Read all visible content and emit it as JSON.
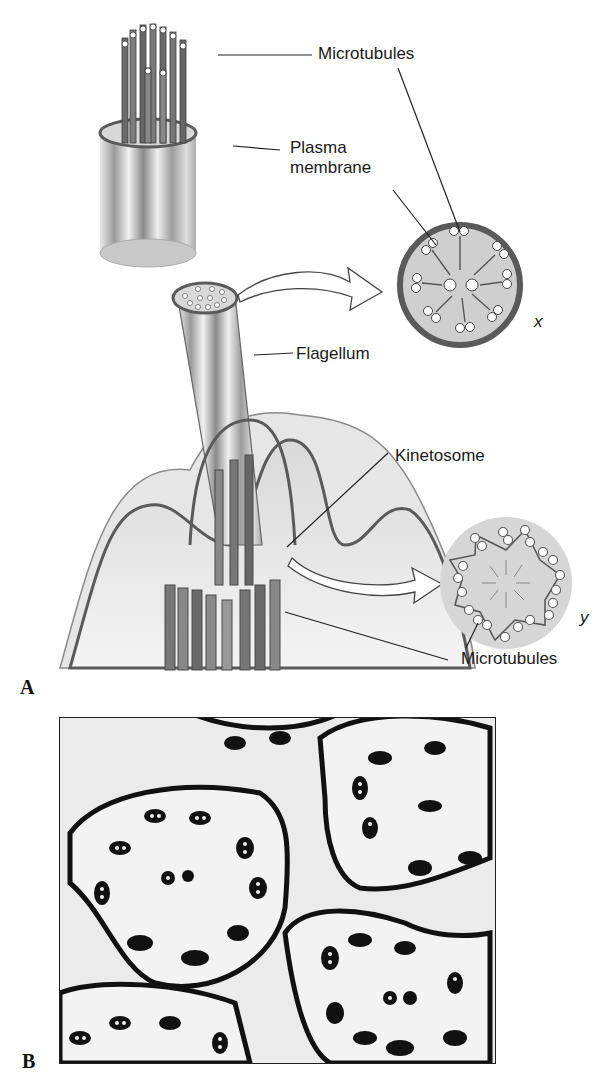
{
  "figure": {
    "panels": [
      {
        "id": "A",
        "label": "A",
        "description": "Illustration of a flagellum with cross sections",
        "labels": {
          "microtubules_top": "Microtubules",
          "plasma_membrane": "Plasma\nmembrane",
          "plasma_membrane_line1": "Plasma",
          "plasma_membrane_line2": "membrane",
          "flagellum": "Flagellum",
          "kinetosome": "Kinetosome",
          "microtubules_bottom": "Microtubules"
        },
        "cross_sections": [
          {
            "id": "x",
            "label": "x",
            "structure": "9+2 axoneme (flagellum cross section)"
          },
          {
            "id": "y",
            "label": "y",
            "structure": "9 triplet (kinetosome cross section)"
          }
        ]
      },
      {
        "id": "B",
        "label": "B",
        "description": "Electron micrograph of flagella cross sections"
      }
    ],
    "colors": {
      "membrane": "#5a5a5a",
      "fill_light": "#d4d4d4",
      "tubule_dark": "#555555",
      "cell_body": "#cfcfcf"
    }
  }
}
